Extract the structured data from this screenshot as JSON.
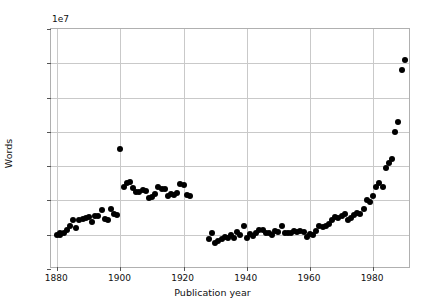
{
  "chart_data": {
    "type": "scatter",
    "title": "",
    "xlabel": "Publication year",
    "ylabel": "Words",
    "y_offset_text": "1e7",
    "y_offset_multiplier": 10000000,
    "xlim": [
      1878,
      1992
    ],
    "ylim": [
      0,
      3.5
    ],
    "grid": true,
    "legend": null,
    "marker": "filled-circle-black",
    "xticks": [
      1880,
      1900,
      1920,
      1940,
      1960,
      1980
    ],
    "xticklabels": [
      "1880",
      "1900",
      "1920",
      "1940",
      "1960",
      "1980"
    ],
    "yticks": [
      0.0,
      0.5,
      1.0,
      1.5,
      2.0,
      2.5,
      3.0,
      3.5
    ],
    "yticklabels": [
      "0.0",
      "0.5",
      "1.0",
      "1.5",
      "2.0",
      "2.5",
      "3.0",
      "3.5"
    ],
    "x": [
      1880,
      1881,
      1881,
      1882,
      1883,
      1884,
      1885,
      1886,
      1887,
      1888,
      1889,
      1890,
      1891,
      1892,
      1893,
      1894,
      1895,
      1896,
      1897,
      1898,
      1899,
      1900,
      1901,
      1902,
      1903,
      1904,
      1905,
      1906,
      1907,
      1908,
      1909,
      1910,
      1911,
      1912,
      1913,
      1914,
      1915,
      1916,
      1917,
      1918,
      1919,
      1920,
      1921,
      1922,
      1928,
      1929,
      1930,
      1931,
      1932,
      1933,
      1934,
      1935,
      1936,
      1937,
      1938,
      1939,
      1940,
      1941,
      1942,
      1943,
      1944,
      1945,
      1946,
      1947,
      1948,
      1949,
      1950,
      1951,
      1952,
      1953,
      1954,
      1955,
      1956,
      1957,
      1958,
      1959,
      1960,
      1961,
      1962,
      1963,
      1964,
      1965,
      1966,
      1967,
      1968,
      1969,
      1970,
      1971,
      1972,
      1973,
      1974,
      1975,
      1976,
      1977,
      1978,
      1979,
      1980,
      1981,
      1982,
      1983,
      1984,
      1985,
      1986,
      1987,
      1988,
      1989,
      1990
    ],
    "y": [
      0.5,
      0.5,
      0.53,
      0.53,
      0.57,
      0.62,
      0.72,
      0.6,
      0.71,
      0.73,
      0.74,
      0.76,
      0.69,
      0.78,
      0.78,
      0.86,
      0.73,
      0.72,
      0.87,
      0.8,
      0.79,
      1.75,
      1.19,
      1.25,
      1.27,
      1.18,
      1.12,
      1.13,
      1.15,
      1.14,
      1.04,
      1.05,
      1.09,
      1.2,
      1.16,
      1.17,
      1.07,
      1.09,
      1.08,
      1.11,
      1.24,
      1.22,
      1.08,
      1.07,
      0.44,
      0.52,
      0.38,
      0.41,
      0.44,
      0.46,
      0.45,
      0.49,
      0.45,
      0.54,
      0.49,
      0.62,
      0.45,
      0.51,
      0.48,
      0.52,
      0.57,
      0.57,
      0.52,
      0.53,
      0.49,
      0.55,
      0.54,
      0.63,
      0.52,
      0.53,
      0.52,
      0.55,
      0.54,
      0.56,
      0.54,
      0.47,
      0.51,
      0.5,
      0.56,
      0.62,
      0.61,
      0.63,
      0.65,
      0.72,
      0.76,
      0.74,
      0.77,
      0.8,
      0.72,
      0.75,
      0.79,
      0.81,
      0.8,
      0.88,
      1.0,
      0.97,
      1.06,
      1.2,
      1.25,
      1.2,
      1.47,
      1.55,
      1.6,
      2.0,
      2.15,
      2.9,
      3.05
    ]
  }
}
